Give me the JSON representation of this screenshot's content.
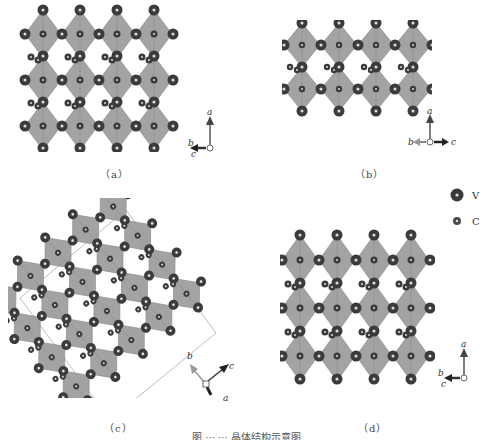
{
  "figure": {
    "panels": [
      {
        "id": "a",
        "label": "（a）",
        "axes": {
          "up": "a",
          "left": "b",
          "left2": "c"
        }
      },
      {
        "id": "b",
        "label": "（b）",
        "axes": {
          "up": "a",
          "left": "b",
          "right": "c"
        }
      },
      {
        "id": "c",
        "label": "（c）",
        "axes": {
          "up_left": "b",
          "up_right": "c",
          "down": "a"
        }
      },
      {
        "id": "d",
        "label": "（d）",
        "axes": {
          "up": "a",
          "left": "b",
          "left2": "c"
        }
      }
    ],
    "legend": [
      {
        "symbol": "large-dark-sphere",
        "label": "V",
        "color": "#3a3a3a"
      },
      {
        "symbol": "small-dark-sphere",
        "label": "C",
        "color": "#4a4a4a"
      }
    ],
    "caption": "图 ··· ··· 晶体结构示意图",
    "colors": {
      "octahedron": "#9a9a9a",
      "octahedron_edge": "#7d7d7d",
      "atom": "#3b3b3b",
      "atom_highlight": "#dcdcdc",
      "cell_line": "#bdbdbd"
    }
  }
}
